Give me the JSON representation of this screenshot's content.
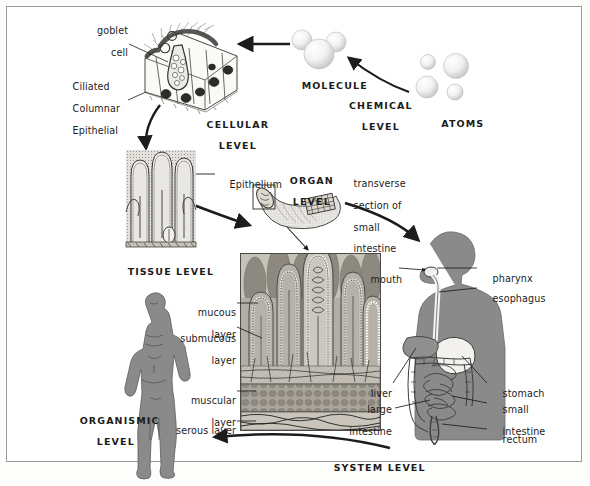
{
  "figure": {
    "border_color": "#9a9a9a",
    "ink_color": "#1c1c1c",
    "body_silhouette_color": "#8a8a8a",
    "micrograph_tint": "#b9b5ad"
  },
  "levels": {
    "chemical": {
      "label_line1": "CHEMICAL",
      "label_line2": "LEVEL"
    },
    "cellular": {
      "label_line1": "CELLULAR",
      "label_line2": "LEVEL"
    },
    "tissue": {
      "label": "TISSUE LEVEL"
    },
    "organ": {
      "label_line1": "ORGAN",
      "label_line2": "LEVEL"
    },
    "organismic": {
      "label_line1": "ORGANISMIC",
      "label_line2": "LEVEL"
    },
    "system": {
      "label": "SYSTEM LEVEL"
    }
  },
  "chemical_level": {
    "molecule_label": "MOLECULE",
    "atoms_label": "ATOMS"
  },
  "cellular_level": {
    "goblet_cell_line1": "goblet",
    "goblet_cell_line2": "cell",
    "epithelium_line1": "Ciliated",
    "epithelium_line2": "Columnar",
    "epithelium_line3": "Epithelial"
  },
  "tissue_level": {
    "epithelium_label": "Epithelium"
  },
  "organ_level": {
    "callout_line1": "transverse",
    "callout_line2": "section of",
    "callout_line3": "small",
    "callout_line4": "intestine"
  },
  "micrograph_labels": [
    {
      "line1": "mucous",
      "line2": "layer"
    },
    {
      "line1": "submucous",
      "line2": "layer"
    },
    {
      "line1": "muscular",
      "line2": "layer"
    },
    {
      "line1": "serous layer",
      "line2": ""
    }
  ],
  "anatomy_labels": {
    "mouth": "mouth",
    "pharynx": "pharynx",
    "esophagus": "esophagus",
    "liver": "liver",
    "stomach": "stomach",
    "large_intestine_line1": "large",
    "large_intestine_line2": "intestine",
    "small_intestine_line1": "small",
    "small_intestine_line2": "intestine",
    "rectum": "rectum"
  }
}
